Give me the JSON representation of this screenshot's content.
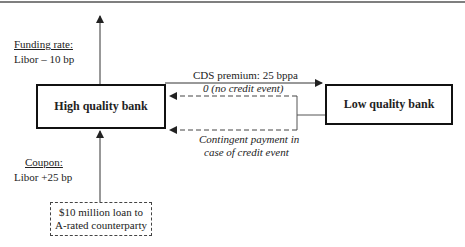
{
  "diagram": {
    "high_bank": {
      "label": "High quality bank"
    },
    "low_bank": {
      "label": "Low quality bank"
    },
    "funding": {
      "title": "Funding rate:",
      "value": "Libor – 10 bp"
    },
    "coupon": {
      "title": "Coupon:",
      "value": "Libor +25  bp"
    },
    "loan": {
      "line1": "$10 million loan to",
      "line2": "A-rated counterparty"
    },
    "cds_premium": "CDS premium: 25 bppa",
    "no_event": "0 (no credit event)",
    "contingent": {
      "line1": "Contingent payment in",
      "line2": "case of credit event"
    },
    "colors": {
      "line": "#333333",
      "box_border": "#111111"
    }
  }
}
